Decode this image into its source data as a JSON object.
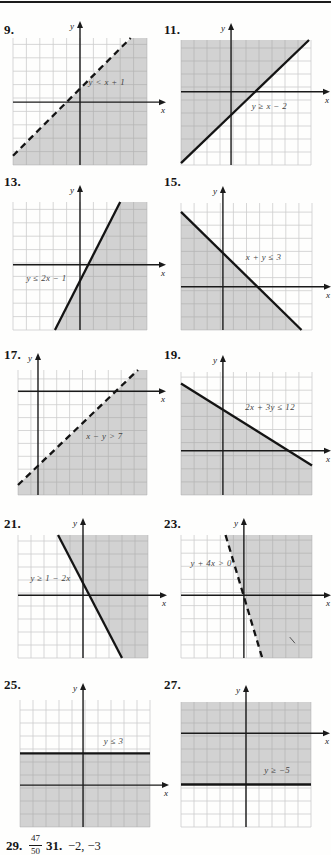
{
  "page": {
    "top_rule_color": "#1c1c1c",
    "background": "#fefefd"
  },
  "colors": {
    "grid": "#cdcdcd",
    "shade": "rgba(150,150,150,0.42)",
    "line": "#141414",
    "axis": "#1a1a1a",
    "label": "#424242"
  },
  "axis_labels": {
    "x": "x",
    "y": "y"
  },
  "answers": [
    {
      "number": "29.",
      "numerator": "47",
      "denominator": "50"
    },
    {
      "number": "31.",
      "value": "−2, −3"
    }
  ],
  "chart_data": [
    {
      "problem": "9.",
      "type": "linear-inequality",
      "inequality": "y < x + 1",
      "boundary": {
        "equation": "y = x + 1",
        "slope": 1,
        "y_intercept": 1,
        "style": "dashed"
      },
      "shaded_region": "below",
      "grid": true,
      "box": [
        13,
        38,
        134,
        127
      ],
      "num": [
        4,
        22
      ],
      "origin": [
        0.5,
        0.505
      ],
      "line": [
        0,
        0.927,
        0.878,
        0
      ],
      "poly": [
        [
          0,
          0.927
        ],
        [
          0.878,
          0
        ],
        [
          1,
          0
        ],
        [
          1,
          1
        ],
        [
          0,
          1
        ]
      ],
      "label_pos": [
        0.7,
        0.37
      ]
    },
    {
      "problem": "11.",
      "type": "linear-inequality",
      "inequality": "y ≥ x − 2",
      "boundary": {
        "equation": "y = x − 2",
        "slope": 1,
        "y_intercept": -2,
        "style": "solid"
      },
      "shaded_region": "above",
      "grid": true,
      "box": [
        181,
        40,
        130,
        125
      ],
      "num": [
        164,
        22
      ],
      "origin": [
        0.385,
        0.414
      ],
      "line": [
        0,
        0.985,
        0.985,
        0
      ],
      "poly": [
        [
          0,
          0.985
        ],
        [
          0.985,
          0
        ],
        [
          0,
          0
        ]
      ],
      "label_pos": [
        0.68,
        0.55
      ]
    },
    {
      "problem": "13.",
      "type": "linear-inequality",
      "inequality": "y ≤ 2x − 1",
      "boundary": {
        "equation": "y = 2x − 1",
        "slope": 2,
        "y_intercept": -1,
        "style": "solid"
      },
      "shaded_region": "below",
      "grid": true,
      "box": [
        13,
        202,
        134,
        128
      ],
      "num": [
        4,
        174
      ],
      "origin": [
        0.5,
        0.49
      ],
      "line": [
        0.313,
        1,
        0.8,
        0
      ],
      "poly": [
        [
          0.313,
          1
        ],
        [
          0.8,
          0
        ],
        [
          1,
          0
        ],
        [
          1,
          1
        ]
      ],
      "label_pos": [
        0.25,
        0.62
      ]
    },
    {
      "problem": "15.",
      "type": "linear-inequality",
      "inequality": "x + y ≤ 3",
      "boundary": {
        "equation": "x + y = 3",
        "slope": -1,
        "y_intercept": 3,
        "style": "solid"
      },
      "shaded_region": "below",
      "grid": true,
      "box": [
        181,
        203,
        131,
        127
      ],
      "num": [
        164,
        174
      ],
      "origin": [
        0.32,
        0.66
      ],
      "line": [
        0,
        0.07,
        0.92,
        1
      ],
      "poly": [
        [
          0,
          0.07
        ],
        [
          0.92,
          1
        ],
        [
          0,
          1
        ]
      ],
      "label_pos": [
        0.63,
        0.45
      ]
    },
    {
      "problem": "17.",
      "type": "linear-inequality",
      "inequality": "x − y > 7",
      "boundary": {
        "equation": "x − y = 7",
        "slope": 1,
        "y_intercept": -7,
        "style": "dashed"
      },
      "shaded_region": "below",
      "grid": true,
      "box": [
        18,
        370,
        129,
        125
      ],
      "num": [
        4,
        347
      ],
      "origin": [
        0.155,
        0.17
      ],
      "line": [
        0,
        0.92,
        0.93,
        0
      ],
      "poly": [
        [
          0,
          0.92
        ],
        [
          0.93,
          0
        ],
        [
          1,
          0
        ],
        [
          1,
          1
        ],
        [
          0,
          1
        ]
      ],
      "label_pos": [
        0.67,
        0.55
      ]
    },
    {
      "problem": "19.",
      "type": "linear-inequality",
      "inequality": "2x + 3y ≤ 12",
      "boundary": {
        "equation": "2x + 3y = 12",
        "slope": -0.667,
        "y_intercept": 4,
        "style": "solid"
      },
      "shaded_region": "below",
      "grid": true,
      "box": [
        181,
        372,
        131,
        123
      ],
      "num": [
        164,
        347
      ],
      "origin": [
        0.32,
        0.64
      ],
      "line": [
        0,
        0.094,
        1,
        0.76
      ],
      "poly": [
        [
          0,
          0.094
        ],
        [
          1,
          0.76
        ],
        [
          1,
          1
        ],
        [
          0,
          1
        ]
      ],
      "label_pos": [
        0.68,
        0.31
      ]
    },
    {
      "problem": "21.",
      "type": "linear-inequality",
      "inequality": "y ≥ 1 − 2x",
      "boundary": {
        "equation": "y = 1 − 2x",
        "slope": -2,
        "y_intercept": 1,
        "style": "solid"
      },
      "shaded_region": "above",
      "grid": true,
      "box": [
        18,
        535,
        130,
        123
      ],
      "num": [
        4,
        516
      ],
      "origin": [
        0.5,
        0.49
      ],
      "line": [
        0.308,
        0,
        0.8,
        1
      ],
      "poly": [
        [
          0.308,
          0
        ],
        [
          0.8,
          1
        ],
        [
          1,
          1
        ],
        [
          1,
          0
        ]
      ],
      "label_pos": [
        0.25,
        0.37
      ]
    },
    {
      "problem": "23.",
      "type": "linear-inequality",
      "inequality": "y + 4x > 0",
      "boundary": {
        "equation": "y = −4x",
        "slope": -4,
        "y_intercept": 0,
        "style": "dashed"
      },
      "shaded_region": "above",
      "grid": true,
      "box": [
        181,
        535,
        131,
        123
      ],
      "num": [
        164,
        516
      ],
      "origin": [
        0.48,
        0.49
      ],
      "line": [
        0.34,
        0,
        0.62,
        1
      ],
      "poly": [
        [
          0.34,
          0
        ],
        [
          0.62,
          1
        ],
        [
          1,
          1
        ],
        [
          1,
          0
        ]
      ],
      "label_pos": [
        0.23,
        0.25
      ],
      "stray_mark": [
        0.83,
        0.83,
        0.87,
        0.88
      ]
    },
    {
      "problem": "25.",
      "type": "linear-inequality",
      "inequality": "y ≤ 3",
      "boundary": {
        "equation": "y = 3",
        "slope": 0,
        "y_intercept": 3,
        "style": "solid"
      },
      "shaded_region": "below",
      "grid": true,
      "box": [
        20,
        700,
        130,
        127
      ],
      "num": [
        4,
        677
      ],
      "origin": [
        0.485,
        0.67
      ],
      "line": [
        0,
        0.42,
        1,
        0.42
      ],
      "poly": [
        [
          0,
          0.42
        ],
        [
          1,
          0.42
        ],
        [
          1,
          1
        ],
        [
          0,
          1
        ]
      ],
      "label_pos": [
        0.72,
        0.35
      ]
    },
    {
      "problem": "27.",
      "type": "linear-inequality",
      "inequality": "y ≥ −5",
      "boundary": {
        "equation": "y = −5",
        "slope": 0,
        "y_intercept": -5,
        "style": "solid"
      },
      "shaded_region": "above",
      "grid": true,
      "box": [
        181,
        702,
        130,
        125
      ],
      "num": [
        164,
        677
      ],
      "origin": [
        0.5,
        0.25
      ],
      "line": [
        0,
        0.66,
        1,
        0.66
      ],
      "poly": [
        [
          0,
          0
        ],
        [
          1,
          0
        ],
        [
          1,
          0.66
        ],
        [
          0,
          0.66
        ]
      ],
      "label_pos": [
        0.74,
        0.57
      ]
    }
  ]
}
